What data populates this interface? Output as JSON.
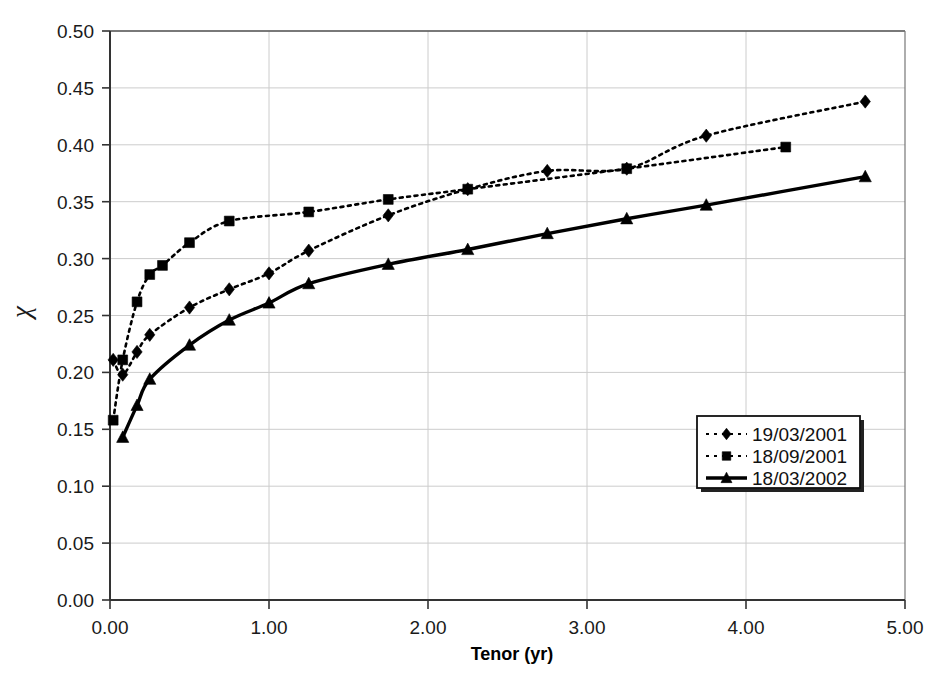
{
  "chart_data": {
    "type": "line",
    "title": "",
    "xlabel": "Tenor (yr)",
    "ylabel": "χ",
    "xlim": [
      0.0,
      5.0
    ],
    "ylim": [
      0.0,
      0.5
    ],
    "xticks": [
      "0.00",
      "1.00",
      "2.00",
      "3.00",
      "4.00",
      "5.00"
    ],
    "xtick_values": [
      0.0,
      1.0,
      2.0,
      3.0,
      4.0,
      5.0
    ],
    "yticks": [
      "0.00",
      "0.05",
      "0.10",
      "0.15",
      "0.20",
      "0.25",
      "0.30",
      "0.35",
      "0.40",
      "0.45",
      "0.50"
    ],
    "ytick_values": [
      0.0,
      0.05,
      0.1,
      0.15,
      0.2,
      0.25,
      0.3,
      0.35,
      0.4,
      0.45,
      0.5
    ],
    "grid": true,
    "grid_x": true,
    "grid_y": true,
    "legend_position": "lower-right",
    "series": [
      {
        "name": "19/03/2001",
        "marker": "diamond",
        "linestyle": "dotted",
        "color": "#000000",
        "x": [
          0.02,
          0.08,
          0.17,
          0.25,
          0.5,
          0.75,
          1.0,
          1.25,
          1.75,
          2.25,
          2.75,
          3.25,
          3.75,
          4.75
        ],
        "y": [
          0.211,
          0.198,
          0.218,
          0.233,
          0.257,
          0.273,
          0.287,
          0.307,
          0.338,
          0.361,
          0.377,
          0.379,
          0.408,
          0.438
        ]
      },
      {
        "name": "18/09/2001",
        "marker": "square",
        "linestyle": "dotted",
        "color": "#000000",
        "x": [
          0.02,
          0.08,
          0.17,
          0.25,
          0.33,
          0.5,
          0.75,
          1.25,
          1.75,
          2.25,
          3.25,
          4.25
        ],
        "y": [
          0.158,
          0.211,
          0.262,
          0.286,
          0.294,
          0.314,
          0.333,
          0.341,
          0.352,
          0.361,
          0.379,
          0.398
        ]
      },
      {
        "name": "18/03/2002",
        "marker": "triangle",
        "linestyle": "solid",
        "color": "#000000",
        "x": [
          0.08,
          0.17,
          0.25,
          0.5,
          0.75,
          1.0,
          1.25,
          1.75,
          2.25,
          2.75,
          3.25,
          3.75,
          4.75
        ],
        "y": [
          0.143,
          0.171,
          0.194,
          0.224,
          0.246,
          0.261,
          0.278,
          0.295,
          0.308,
          0.322,
          0.335,
          0.347,
          0.372
        ]
      }
    ]
  },
  "legend": {
    "items": [
      {
        "label": "19/03/2001",
        "marker": "diamond",
        "linestyle": "dotted"
      },
      {
        "label": "18/09/2001",
        "marker": "square",
        "linestyle": "dotted"
      },
      {
        "label": "18/03/2002",
        "marker": "triangle",
        "linestyle": "solid"
      }
    ]
  },
  "colors": {
    "background": "#ffffff",
    "axis": "#333333",
    "grid": "#cccccc",
    "series": "#000000",
    "text": "#111111"
  }
}
